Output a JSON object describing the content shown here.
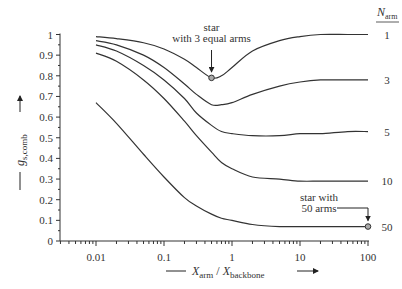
{
  "chart_data": {
    "type": "line",
    "title": "",
    "xlabel": {
      "main": "X",
      "sub1": "arm",
      "sep": " / ",
      "main2": "X",
      "sub2": "backbone"
    },
    "ylabel": {
      "main": "g",
      "sub": "s,comb"
    },
    "xscale": "log",
    "xlim": [
      0.003,
      100
    ],
    "ylim": [
      0,
      1
    ],
    "x_ticks": [
      0.01,
      0.1,
      1,
      10,
      100
    ],
    "x_tick_labels": [
      "0.01",
      "0.1",
      "1",
      "10",
      "100"
    ],
    "y_ticks": [
      0,
      0.1,
      0.2,
      0.3,
      0.4,
      0.5,
      0.6,
      0.7,
      0.8,
      0.9,
      1
    ],
    "y_tick_labels": [
      "0",
      "0.1",
      "0.2",
      "0.3",
      "0.4",
      "0.5",
      "0.6",
      "0.7",
      "0.8",
      "0.9",
      "1"
    ],
    "grid": false,
    "legend_title": {
      "main": "N",
      "sub": "arm"
    },
    "legend_position": "right, at line ends",
    "x": [
      0.01,
      0.02,
      0.05,
      0.1,
      0.2,
      0.3,
      0.5,
      0.7,
      1,
      2,
      5,
      10,
      20,
      50,
      100
    ],
    "series": [
      {
        "name": "1",
        "values": [
          0.99,
          0.98,
          0.96,
          0.93,
          0.88,
          0.84,
          0.79,
          0.8,
          0.84,
          0.92,
          0.97,
          0.99,
          1.0,
          1.0,
          1.0
        ]
      },
      {
        "name": "3",
        "values": [
          0.97,
          0.95,
          0.9,
          0.84,
          0.76,
          0.71,
          0.66,
          0.66,
          0.67,
          0.71,
          0.75,
          0.77,
          0.78,
          0.78,
          0.78
        ]
      },
      {
        "name": "5",
        "values": [
          0.95,
          0.92,
          0.85,
          0.78,
          0.69,
          0.62,
          0.56,
          0.53,
          0.52,
          0.51,
          0.51,
          0.52,
          0.52,
          0.53,
          0.53
        ]
      },
      {
        "name": "10",
        "values": [
          0.91,
          0.87,
          0.78,
          0.69,
          0.58,
          0.51,
          0.43,
          0.38,
          0.35,
          0.31,
          0.3,
          0.29,
          0.29,
          0.29,
          0.29
        ]
      },
      {
        "name": "50",
        "values": [
          0.67,
          0.57,
          0.42,
          0.31,
          0.21,
          0.17,
          0.13,
          0.11,
          0.1,
          0.08,
          0.07,
          0.07,
          0.07,
          0.07,
          0.07
        ]
      }
    ],
    "annotations": [
      {
        "lines": [
          "star",
          "with 3 equal arms"
        ],
        "x": 0.5,
        "y": 0.79,
        "series": "1"
      },
      {
        "lines": [
          "star with",
          "50 arms"
        ],
        "x": 100,
        "y": 0.07,
        "series": "50"
      }
    ]
  }
}
